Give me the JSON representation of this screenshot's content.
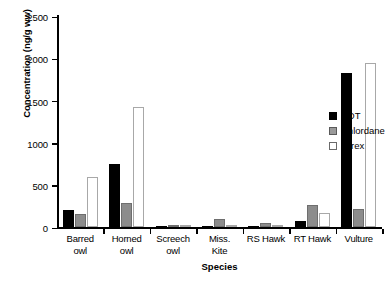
{
  "chart_data": {
    "type": "bar",
    "title": "",
    "xlabel": "Species",
    "ylabel": "Concentration (ng/g ww)",
    "ylim": [
      0,
      2500
    ],
    "yticks": [
      0,
      500,
      1000,
      1500,
      2000,
      2500
    ],
    "ytick_labels": [
      "0",
      "500",
      "1000",
      "1500",
      "2000",
      "2500"
    ],
    "grid": false,
    "legend_position": "right",
    "categories": [
      "Barred\nowl",
      "Horned\nowl",
      "Screech\nowl",
      "Miss.\nKite",
      "RS Hawk",
      "RT Hawk",
      "Vulture"
    ],
    "series": [
      {
        "name": "DDT",
        "color": "#000000",
        "values": [
          200,
          755,
          5,
          8,
          15,
          75,
          1840
        ]
      },
      {
        "name": "Chlordane",
        "color": "#8c8c8c",
        "values": [
          150,
          290,
          5,
          100,
          45,
          265,
          210
        ]
      },
      {
        "name": "Mirex",
        "color": "#ffffff",
        "values": [
          595,
          1435,
          3,
          20,
          10,
          170,
          1960
        ]
      }
    ]
  },
  "axes": {
    "y_title": "Concentration (ng/g ww)",
    "x_title": "Species",
    "y_tick_0": "0",
    "y_tick_1": "500",
    "y_tick_2": "1000",
    "y_tick_3": "1500",
    "y_tick_4": "2000",
    "y_tick_5": "2500"
  },
  "legend": {
    "items": [
      {
        "label": "DDT"
      },
      {
        "label": "Chlordane"
      },
      {
        "label": "Mirex"
      }
    ]
  },
  "xlabels": {
    "c0": "Barred\nowl",
    "c1": "Horned\nowl",
    "c2": "Screech\nowl",
    "c3": "Miss.\nKite",
    "c4": "RS Hawk",
    "c5": "RT Hawk",
    "c6": "Vulture"
  }
}
